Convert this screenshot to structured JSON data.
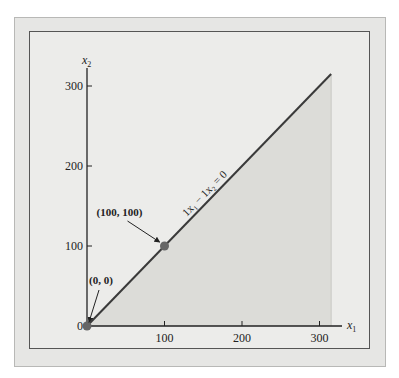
{
  "chart_data": {
    "type": "line",
    "title": "",
    "xlabel": "x₁",
    "ylabel": "x₂",
    "x_axis_symbol": "x",
    "x_axis_sub": "1",
    "y_axis_symbol": "x",
    "y_axis_sub": "2",
    "xlim": [
      0,
      320
    ],
    "ylim": [
      0,
      310
    ],
    "xticks": [
      0,
      100,
      200,
      300
    ],
    "yticks": [
      0,
      100,
      200,
      300
    ],
    "xtick_labels": [
      "100",
      "200",
      "300"
    ],
    "ytick_labels": [
      "0",
      "100",
      "200",
      "300"
    ],
    "grid": false,
    "series": [
      {
        "name": "1x1 - 1x2 = 0",
        "points": [
          [
            0,
            0
          ],
          [
            315,
            315
          ]
        ],
        "label_text": "1x₁ − 1x₂ = 0"
      }
    ],
    "shaded_region": {
      "description": "feasible region below line x2 = x1",
      "vertices": [
        [
          0,
          0
        ],
        [
          315,
          315
        ],
        [
          315,
          0
        ]
      ],
      "color": "#dcdcd8"
    },
    "points": [
      {
        "label": "(0, 0)",
        "x": 0,
        "y": 0
      },
      {
        "label": "(100, 100)",
        "x": 100,
        "y": 100
      }
    ],
    "colors": {
      "axis": "#222222",
      "line": "#3a3a3a",
      "point": "#666666",
      "panel": "#ececea",
      "frame": "#e6e6e4"
    }
  }
}
